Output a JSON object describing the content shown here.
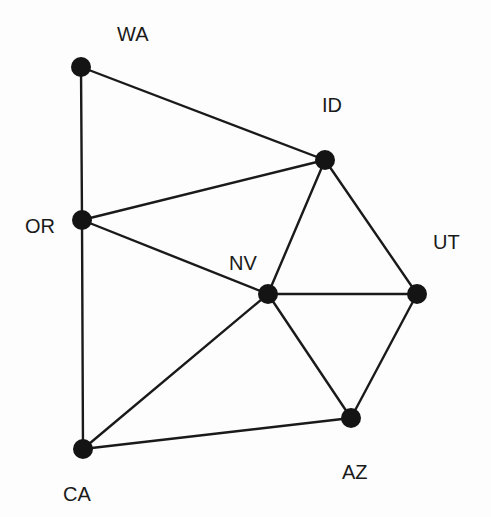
{
  "diagram": {
    "type": "undirected-graph",
    "nodes": [
      {
        "id": "WA",
        "label": "WA",
        "x": 81,
        "y": 67,
        "label_x": 117,
        "label_y": 24
      },
      {
        "id": "ID",
        "label": "ID",
        "x": 325,
        "y": 160,
        "label_x": 322,
        "label_y": 95
      },
      {
        "id": "OR",
        "label": "OR",
        "x": 82,
        "y": 220,
        "label_x": 25,
        "label_y": 216
      },
      {
        "id": "NV",
        "label": "NV",
        "x": 268,
        "y": 294,
        "label_x": 229,
        "label_y": 253
      },
      {
        "id": "UT",
        "label": "UT",
        "x": 417,
        "y": 294,
        "label_x": 433,
        "label_y": 232
      },
      {
        "id": "AZ",
        "label": "AZ",
        "x": 351,
        "y": 418,
        "label_x": 342,
        "label_y": 462
      },
      {
        "id": "CA",
        "label": "CA",
        "x": 83,
        "y": 449,
        "label_x": 63,
        "label_y": 484
      }
    ],
    "edges": [
      [
        "WA",
        "ID"
      ],
      [
        "WA",
        "OR"
      ],
      [
        "OR",
        "ID"
      ],
      [
        "OR",
        "NV"
      ],
      [
        "OR",
        "CA"
      ],
      [
        "ID",
        "NV"
      ],
      [
        "ID",
        "UT"
      ],
      [
        "NV",
        "UT"
      ],
      [
        "NV",
        "AZ"
      ],
      [
        "NV",
        "CA"
      ],
      [
        "UT",
        "AZ"
      ],
      [
        "CA",
        "AZ"
      ]
    ]
  }
}
